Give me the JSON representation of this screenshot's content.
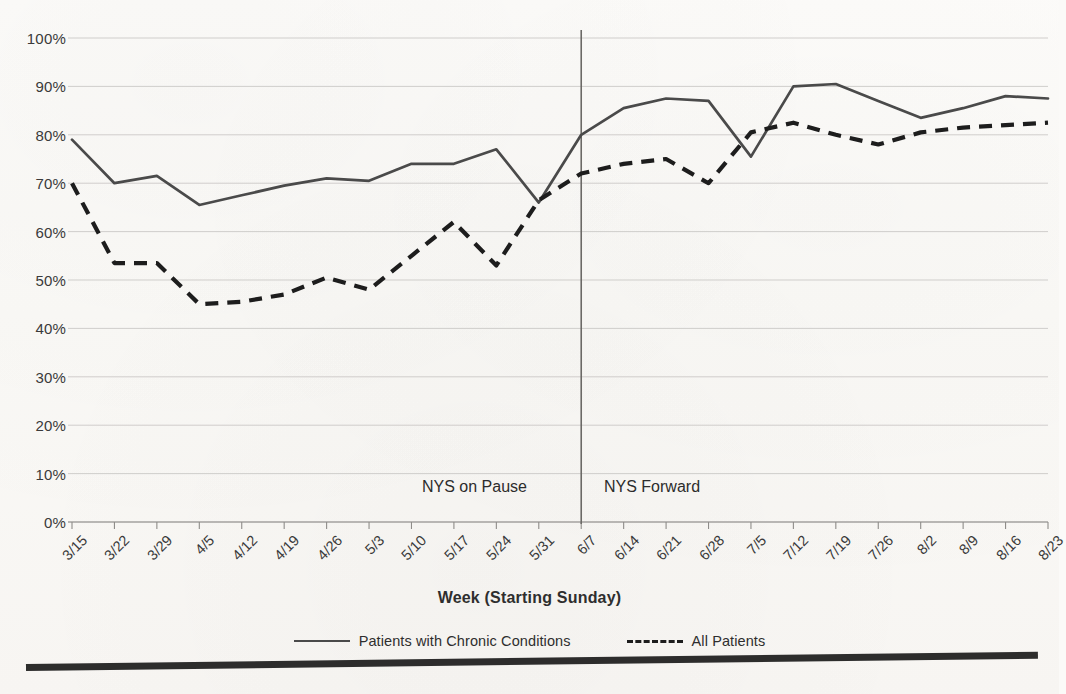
{
  "chart_data": {
    "type": "line",
    "title": "",
    "xlabel": "Week (Starting Sunday)",
    "ylabel": "",
    "ylim": [
      0,
      100
    ],
    "ytick_labels": [
      "100%",
      "90%",
      "80%",
      "70%",
      "60%",
      "50%",
      "40%",
      "30%",
      "20%",
      "10%",
      "0%"
    ],
    "ytick_values": [
      100,
      90,
      80,
      70,
      60,
      50,
      40,
      30,
      20,
      10,
      0
    ],
    "grid": true,
    "legend_position": "bottom",
    "categories": [
      "3/15",
      "3/22",
      "3/29",
      "4/5",
      "4/12",
      "4/19",
      "4/26",
      "5/3",
      "5/10",
      "5/17",
      "5/24",
      "5/31",
      "6/7",
      "6/14",
      "6/21",
      "6/28",
      "7/5",
      "7/12",
      "7/19",
      "7/26",
      "8/2",
      "8/9",
      "8/16",
      "8/23"
    ],
    "series": [
      {
        "name": "Patients with Chronic Conditions",
        "style": "solid",
        "color": "#4a4a4a",
        "values": [
          79,
          70,
          71.5,
          65.5,
          67.5,
          69.5,
          71,
          70.5,
          74,
          74,
          77,
          66,
          80,
          85.5,
          87.5,
          87,
          75.5,
          90,
          90.5,
          87,
          83.5,
          85.5,
          88,
          87.5
        ]
      },
      {
        "name": "All Patients",
        "style": "dashed",
        "color": "#1d1d1d",
        "values": [
          70,
          53.5,
          53.5,
          45,
          45.5,
          47,
          50.5,
          48,
          55,
          62,
          53,
          66.5,
          72,
          74,
          75,
          70,
          80.5,
          82.5,
          80,
          78,
          80.5,
          81.5,
          82,
          82.5
        ]
      }
    ],
    "annotations": [
      {
        "name": "nys-on-pause",
        "text": "NYS on Pause",
        "x_category": "5/10"
      },
      {
        "name": "nys-forward",
        "text": "NYS Forward",
        "x_category": "6/14"
      },
      {
        "name": "phase-divider",
        "text": "",
        "x_category": "6/7"
      }
    ]
  },
  "legend": {
    "entries": [
      {
        "label": "Patients with Chronic Conditions",
        "style": "solid"
      },
      {
        "label": "All Patients",
        "style": "dashed"
      }
    ]
  }
}
